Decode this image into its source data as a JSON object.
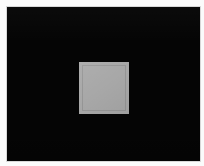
{
  "scene": {
    "title": "Gray square on black field",
    "description": "A near-white page containing a large solid black rectangular panel, with a single medium-gray square centered slightly left of center.",
    "width": 204,
    "height": 166
  },
  "page": {
    "background_color": "#fbfbfb",
    "edge_color": "#fdfdfd"
  },
  "panel": {
    "name": "black-panel",
    "fill_color": "#050505",
    "border_color": "#d8d8d8",
    "x": 7,
    "y": 7,
    "width": 193,
    "height": 154
  },
  "square": {
    "name": "gray-square",
    "fill_color": "#a8a8a8",
    "inner_frame_color": "#969696",
    "x": 79,
    "y": 62,
    "width": 50,
    "height": 52
  }
}
